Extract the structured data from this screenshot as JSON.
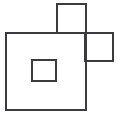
{
  "figure": {
    "background_color": "#ffffff",
    "stroke_color": "#3b3b3f",
    "stroke_width": 1.4,
    "canvas": {
      "width": 120,
      "height": 119
    },
    "shapes": [
      {
        "name": "large-square",
        "label": "Large square",
        "x": 6,
        "y": 33,
        "width": 80,
        "height": 77
      },
      {
        "name": "top-square",
        "label": "Top square",
        "x": 57,
        "y": 4,
        "width": 29,
        "height": 29
      },
      {
        "name": "right-square",
        "label": "Right square",
        "x": 85,
        "y": 33,
        "width": 28,
        "height": 28
      },
      {
        "name": "inner-small-square",
        "label": "Small inner square",
        "x": 32,
        "y": 60,
        "width": 24,
        "height": 21
      }
    ]
  }
}
